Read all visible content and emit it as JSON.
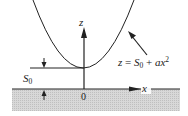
{
  "diagram": {
    "type": "physics-sketch",
    "curve_label": {
      "lhs": "z",
      "eq": " = ",
      "s": "S",
      "sub": "0",
      "plus": " + ",
      "ax": "ax",
      "sup": "2"
    },
    "axes": {
      "z_label": "z",
      "x_label": "x",
      "origin_label": "0"
    },
    "height_label": {
      "s": "S",
      "sub": "0"
    },
    "colors": {
      "line": "#222222",
      "ground_fill": "#d4d4d4",
      "hatch": "#bdbdbd",
      "background": "#ffffff"
    }
  }
}
